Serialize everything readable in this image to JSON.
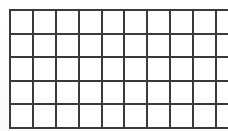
{
  "figure": {
    "kind": "grid",
    "columns": 10,
    "rows": 5,
    "total_cells": 50,
    "cell_text": "",
    "colors": {
      "line": "#3a3a3a",
      "cell_fill": "#ffffff",
      "background": "#fefefe"
    },
    "geometry": {
      "left": 9,
      "top": 9,
      "width": 209,
      "height": 108,
      "cell_width": 20.9,
      "cell_height": 21.6,
      "line_thickness": 2
    }
  },
  "chart_data": {
    "type": "table",
    "title": "",
    "xlabel": "",
    "ylabel": "",
    "columns": 10,
    "rows": 5,
    "grid": true,
    "legend": "none",
    "cells": [
      [
        "",
        "",
        "",
        "",
        "",
        "",
        "",
        "",
        "",
        ""
      ],
      [
        "",
        "",
        "",
        "",
        "",
        "",
        "",
        "",
        "",
        ""
      ],
      [
        "",
        "",
        "",
        "",
        "",
        "",
        "",
        "",
        "",
        ""
      ],
      [
        "",
        "",
        "",
        "",
        "",
        "",
        "",
        "",
        "",
        ""
      ],
      [
        "",
        "",
        "",
        "",
        "",
        "",
        "",
        "",
        "",
        ""
      ]
    ]
  }
}
